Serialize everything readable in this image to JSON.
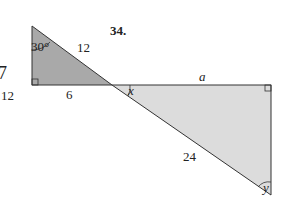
{
  "problem": {
    "number": "34."
  },
  "stray_mark": {
    "glyph": "7",
    "value": "12"
  },
  "left_triangle": {
    "angle_top": "30°",
    "hypotenuse": "12",
    "base": "6",
    "fill": "#a9a9a9"
  },
  "right_triangle": {
    "top_side": "a",
    "hypotenuse": "24",
    "angle_left": "x",
    "angle_bottom": "y",
    "fill": "#d9d9d9"
  },
  "stroke_color": "#333333"
}
